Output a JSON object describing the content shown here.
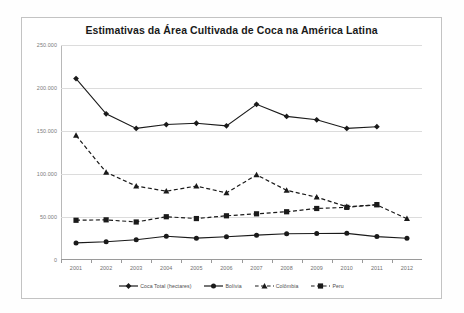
{
  "chart_data": {
    "type": "line",
    "title": "Estimativas da Área Cultivada de Coca na América Latina",
    "xlabel": "",
    "ylabel": "",
    "categories": [
      "2001",
      "2002",
      "2003",
      "2004",
      "2005",
      "2006",
      "2007",
      "2008",
      "2009",
      "2010",
      "2011",
      "2012"
    ],
    "ylim": [
      0,
      250000
    ],
    "ytick_labels": [
      "0",
      "50.000",
      "100.000",
      "150.000",
      "200.000",
      "250.000"
    ],
    "ytick_values": [
      0,
      50000,
      100000,
      150000,
      200000,
      250000
    ],
    "grid": true,
    "legend_position": "bottom",
    "series": [
      {
        "name": "Coca Total (hectares)",
        "marker": "diamond",
        "line_style": "solid",
        "color": "#1a1a1a",
        "values": [
          211000,
          170000,
          153000,
          157500,
          159000,
          156000,
          181000,
          167000,
          163000,
          153000,
          155000,
          null
        ]
      },
      {
        "name": "Bolívia",
        "marker": "circle",
        "line_style": "solid",
        "color": "#1a1a1a",
        "values": [
          19900,
          21200,
          23600,
          27700,
          25400,
          27000,
          28900,
          30500,
          30900,
          31000,
          27200,
          25300
        ]
      },
      {
        "name": "Colômbia",
        "marker": "triangle",
        "line_style": "dashed",
        "color": "#1a1a1a",
        "values": [
          144800,
          102000,
          86000,
          80000,
          86000,
          78000,
          99000,
          81000,
          73000,
          62000,
          64000,
          48000
        ]
      },
      {
        "name": "Peru",
        "marker": "square",
        "line_style": "dashed",
        "color": "#1a1a1a",
        "values": [
          46200,
          46700,
          44200,
          50300,
          48200,
          51400,
          53700,
          56100,
          59900,
          61200,
          64400,
          null
        ]
      }
    ]
  },
  "legend": {
    "items": [
      {
        "label": "Coca Total (hectares)",
        "marker": "diamond",
        "line_style": "solid"
      },
      {
        "label": "Bolívia",
        "marker": "circle",
        "line_style": "solid"
      },
      {
        "label": "Colômbia",
        "marker": "triangle",
        "line_style": "dashed"
      },
      {
        "label": "Peru",
        "marker": "square",
        "line_style": "dashed"
      }
    ]
  }
}
